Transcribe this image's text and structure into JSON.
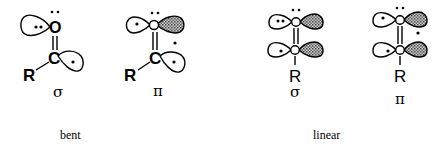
{
  "diagram": {
    "structures": [
      {
        "id": "bent-sigma",
        "group": "bent",
        "symbol": "σ",
        "substituent": "R",
        "top_atom": "O",
        "bottom_atom": "C"
      },
      {
        "id": "bent-pi",
        "group": "bent",
        "symbol": "π",
        "substituent": "R",
        "top_atom": "O",
        "bottom_atom": "C"
      },
      {
        "id": "linear-sigma",
        "group": "linear",
        "symbol": "σ",
        "substituent": "R",
        "top_atom": "O",
        "bottom_atom": "C"
      },
      {
        "id": "linear-pi",
        "group": "linear",
        "symbol": "π",
        "substituent": "R",
        "top_atom": "O",
        "bottom_atom": "C"
      }
    ],
    "captions": {
      "bent": "bent",
      "linear": "linear"
    },
    "colors": {
      "line": "#000000",
      "background": "#ffffff",
      "shading": "#555555"
    }
  }
}
